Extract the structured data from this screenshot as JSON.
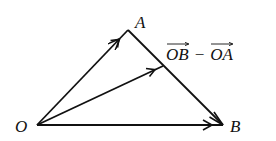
{
  "diagram": {
    "type": "vector-triangle",
    "stroke_color": "#111111",
    "points": {
      "O": {
        "label": "O",
        "x": 37,
        "y": 125
      },
      "A": {
        "label": "A",
        "x": 128,
        "y": 30
      },
      "B": {
        "label": "B",
        "x": 223,
        "y": 125
      },
      "M": {
        "x": 163,
        "y": 66
      }
    },
    "vectors": [
      {
        "id": "OA",
        "from": "O",
        "to": "A",
        "arrow_position": "mid"
      },
      {
        "id": "OM",
        "from": "O",
        "to": "M",
        "arrow_position": "mid"
      },
      {
        "id": "OB",
        "from": "O",
        "to": "B",
        "arrow_position": "end"
      },
      {
        "id": "AB",
        "from": "A",
        "to": "B",
        "arrow_position": "end"
      }
    ],
    "labels": {
      "O": "O",
      "A": "A",
      "B": "B"
    },
    "expression": {
      "term1": "OB",
      "operator": "−",
      "term2": "OA"
    }
  }
}
